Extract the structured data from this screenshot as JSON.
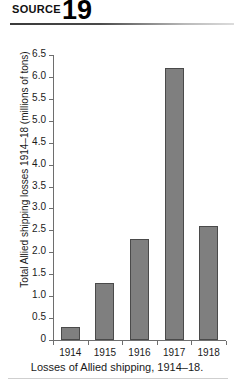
{
  "header": {
    "source_label": "SOURCE",
    "source_number": "19"
  },
  "caption": "Losses of Allied shipping, 1914–18.",
  "chart_data": {
    "type": "bar",
    "title": "",
    "xlabel": "",
    "ylabel": "Total Allied shipping losses 1914–18 (millions of tons)",
    "categories": [
      "1914",
      "1915",
      "1916",
      "1917",
      "1918"
    ],
    "values": [
      0.3,
      1.3,
      2.3,
      6.2,
      2.6
    ],
    "ylim": [
      0,
      6.5
    ],
    "ytick_step": 0.5,
    "ytick_labels": [
      "6.5",
      "6.0",
      "5.5",
      "5.0",
      "4.5",
      "4.0",
      "3.5",
      "3.0",
      "2.5",
      "2.0",
      "1.5",
      "1.0",
      "0.5",
      "0"
    ],
    "ytick_values": [
      6.5,
      6.0,
      5.5,
      5.0,
      4.5,
      4.0,
      3.5,
      3.0,
      2.5,
      2.0,
      1.5,
      1.0,
      0.5,
      0
    ],
    "grid": false,
    "legend": "none",
    "bar_color": "#7f7f7f",
    "bar_border_color": "#4a4a4a",
    "axis_color": "#6e6e6e"
  }
}
